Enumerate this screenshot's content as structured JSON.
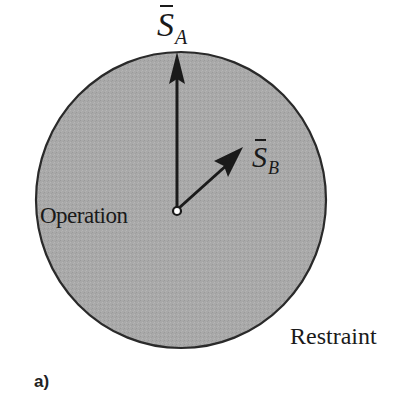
{
  "figure": {
    "panel_label": "a)",
    "region": {
      "label": "Restraint",
      "fill_color": "#a9a9a9",
      "stroke_color": "#2a2a2a",
      "shape": "circle"
    },
    "origin": {
      "label": "Operation"
    },
    "vectors": [
      {
        "id": "S_A",
        "symbol": "S",
        "subscript": "A",
        "overbar": true,
        "direction": "up",
        "color": "#1a1a1a"
      },
      {
        "id": "S_B",
        "symbol": "S",
        "subscript": "B",
        "overbar": true,
        "direction": "up-right",
        "color": "#1a1a1a"
      }
    ]
  }
}
